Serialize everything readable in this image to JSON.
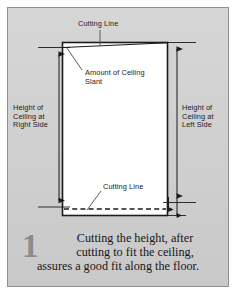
{
  "figure": {
    "panel_bg": "#d2d2d2",
    "line_color": "#1b1b1b",
    "panel_border": "#8f8f8f"
  },
  "labels": {
    "cutting_line_top": "Cutting Line",
    "amount_of_ceiling_slant": "Amount of Ceiling\nSlant",
    "height_left_side": "Height of\nCeiling at\nRight Side",
    "height_right_side": "Height of\nCeiling at\nLeft Side",
    "cutting_line_bottom": "Cutting Line"
  },
  "caption": {
    "number": "1",
    "line1": "Cutting the height, after",
    "line2": "cutting to fit the ceiling,",
    "line3": "assures a good fit along the floor."
  }
}
